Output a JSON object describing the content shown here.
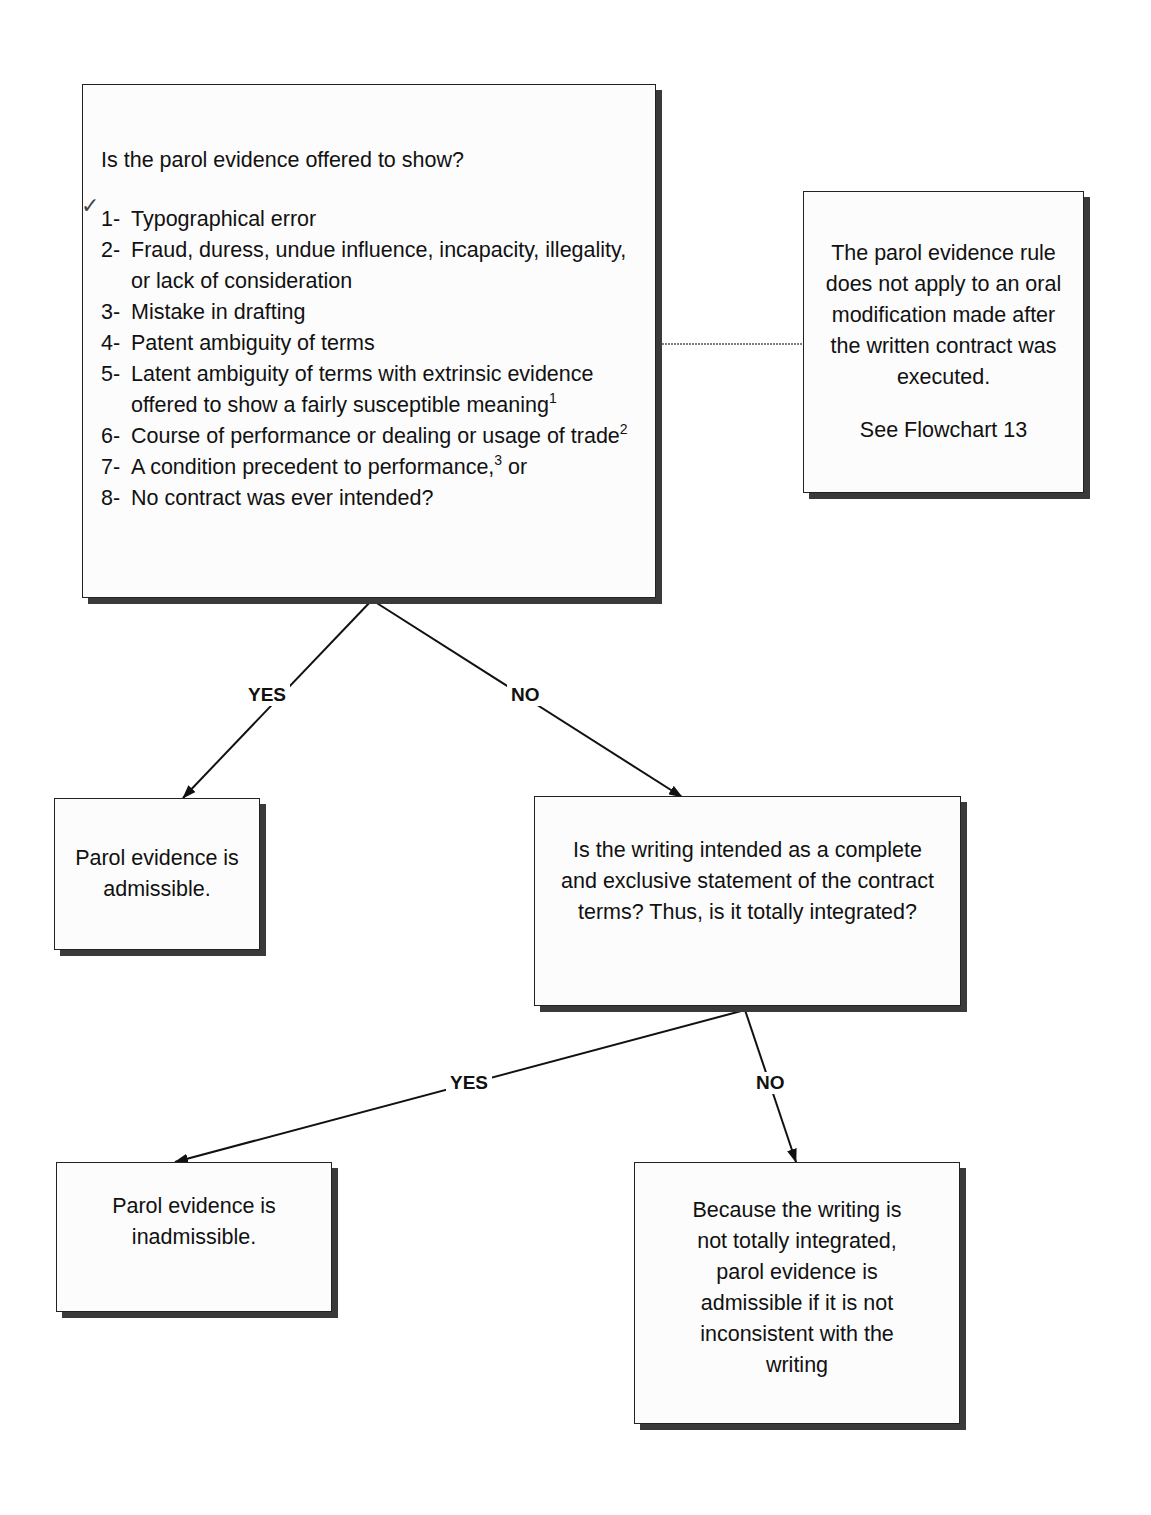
{
  "main_question": {
    "title": "Is the parol evidence offered to show?",
    "items": [
      {
        "num": "1-",
        "text": "Typographical error",
        "sup": ""
      },
      {
        "num": "2-",
        "text": "Fraud, duress, undue influence, incapacity, illegality, or lack of consideration",
        "sup": ""
      },
      {
        "num": "3-",
        "text": "Mistake in drafting",
        "sup": ""
      },
      {
        "num": "4-",
        "text": "Patent ambiguity of terms",
        "sup": ""
      },
      {
        "num": "5-",
        "text": "Latent ambiguity of terms with extrinsic evidence offered to show a fairly susceptible meaning",
        "sup": "1"
      },
      {
        "num": "6-",
        "text": "Course of performance or dealing or usage of trade",
        "sup": "2"
      },
      {
        "num": "7-",
        "text": "A condition precedent to performance,",
        "sup": "3",
        "after": " or"
      },
      {
        "num": "8-",
        "text": "No contract was ever intended?",
        "sup": ""
      }
    ],
    "annotation": "✓"
  },
  "side_note": {
    "text": "The parol evidence rule does not apply to an oral modification made after the written contract was executed.",
    "reference": "See Flowchart 13"
  },
  "branch1": {
    "yes_label": "YES",
    "no_label": "NO"
  },
  "admissible_box": {
    "text": "Parol evidence is admissible."
  },
  "integration_question": {
    "text": "Is the writing intended as a complete and exclusive statement of the contract terms? Thus, is it totally integrated?"
  },
  "branch2": {
    "yes_label": "YES",
    "no_label": "NO"
  },
  "inadmissible_box": {
    "text": "Parol evidence is inadmissible."
  },
  "partial_box": {
    "text": "Because the writing is not totally integrated, parol evidence is admissible if it is not inconsistent with the writing"
  }
}
